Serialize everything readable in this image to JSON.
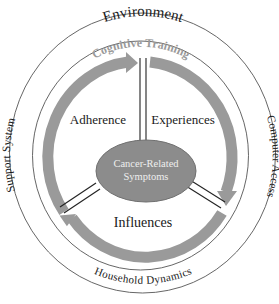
{
  "diagram": {
    "outer_ring": {
      "top_label": "Environment",
      "left_label": "Support System",
      "right_label": "Computer Access",
      "bottom_label": "Household Dynamics"
    },
    "inner_ring": {
      "top_label": "Cognitive Training"
    },
    "segments": {
      "upper_left": "Adherence",
      "upper_right": "Experiences",
      "bottom": "Influences"
    },
    "center": {
      "line1": "Cancer-Related",
      "line2": "Symptoms"
    },
    "colors": {
      "arrow": "#9a9a9a",
      "ellipse_fill": "#8c8c8c",
      "ellipse_stroke": "#707070",
      "cognitive_training_text": "#9a9a9a",
      "ring_stroke": "#555555",
      "text": "#1a1a1a"
    }
  }
}
